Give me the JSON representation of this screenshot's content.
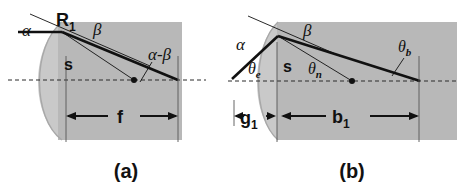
{
  "figure": {
    "background_color": "#ffffff",
    "lens_fill_color": "#b8b8b8",
    "lens_arc_color": "#c9c9c9",
    "ray_color": "#111111",
    "axis_color": "#333333",
    "panels": [
      {
        "id": "a",
        "caption": "(a)",
        "caption_x": 126,
        "caption_y": 176,
        "labels": {
          "alpha": "α",
          "R1": "R",
          "R1_sub": "1",
          "beta": "β",
          "alpha_minus_beta": "α-β",
          "s": "s",
          "f": "f"
        },
        "geometry": {
          "body_x": 58,
          "body_y": 22,
          "body_w": 124,
          "body_h": 118,
          "vertex_x": 62,
          "vertex_y": 32,
          "axis_y": 80,
          "focal_dot_x": 134,
          "focal_dot_y": 80,
          "thick_ray_end_x": 178,
          "thick_ray_end_y": 80,
          "dim_left_x": 66,
          "dim_right_x": 178,
          "dim_y": 116
        }
      },
      {
        "id": "b",
        "caption": "(b)",
        "caption_x": 352,
        "caption_y": 176,
        "labels": {
          "alpha": "α",
          "beta": "β",
          "theta_e": "θ",
          "theta_e_sub": "e",
          "theta_n": "θ",
          "theta_n_sub": "n",
          "theta_b": "θ",
          "theta_b_sub": "b",
          "s": "s",
          "g1": "g",
          "g1_sub": "1",
          "b1": "b",
          "b1_sub": "1"
        },
        "geometry": {
          "body_x": 277,
          "body_y": 22,
          "body_w": 180,
          "body_h": 118,
          "vertex_x": 278,
          "vertex_y": 36,
          "axis_y": 81,
          "focal_dot_x": 352,
          "focal_dot_y": 81,
          "entry_ray_start_x": 232,
          "entry_ray_start_y": 79,
          "thick_ray_end_x": 420,
          "thick_ray_end_y": 81,
          "g1_left_x": 234,
          "g1_right_x": 276,
          "b1_left_x": 281,
          "b1_right_x": 419,
          "dim_y": 116
        }
      }
    ]
  }
}
